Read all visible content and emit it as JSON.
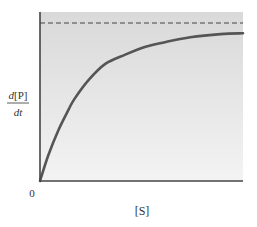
{
  "chart_data": {
    "type": "line",
    "title": "",
    "xlabel": "[S]",
    "ylabel": {
      "numerator_italic": "d",
      "numerator_rest": "[P]",
      "denominator": "dt"
    },
    "origin_label": "0",
    "xlim": [
      0,
      10
    ],
    "ylim": [
      0,
      1.07
    ],
    "grid": false,
    "legend": "none",
    "series": [
      {
        "name": "reaction-rate",
        "style": "solid",
        "x": [
          0,
          0.4,
          0.9,
          1.4,
          1.7,
          2.4,
          3.2,
          4.2,
          5.2,
          6.2,
          7.4,
          8.9,
          10.0
        ],
        "y": [
          0,
          0.16,
          0.32,
          0.45,
          0.52,
          0.64,
          0.74,
          0.8,
          0.85,
          0.88,
          0.91,
          0.93,
          0.935
        ]
      },
      {
        "name": "vmax-asymptote",
        "style": "dashed",
        "x": [
          0,
          10
        ],
        "y": [
          1.0,
          1.0
        ]
      }
    ]
  }
}
